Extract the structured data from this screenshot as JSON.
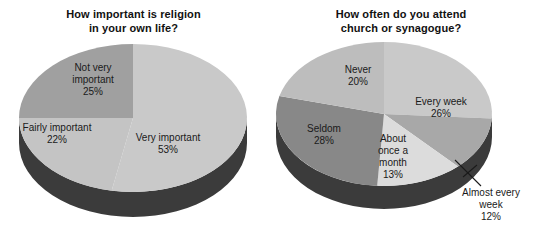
{
  "chart_data": [
    {
      "type": "pie",
      "id": "religion-importance",
      "title": "How important is religion\nin your own life?",
      "categories": [
        "Very important",
        "Not very important",
        "Fairly important"
      ],
      "values": [
        53,
        25,
        22
      ],
      "value_suffix": "%",
      "labels": [
        {
          "name": "Very important",
          "percent": "53%",
          "color": "#c9c9c9"
        },
        {
          "name": "Not very important",
          "percent": "25%",
          "color": "#a0a0a0"
        },
        {
          "name": "Fairly important",
          "percent": "22%",
          "color": "#c4c4c4"
        }
      ],
      "side_color": "#3b3b3b",
      "legend": "none",
      "grid": false
    },
    {
      "type": "pie",
      "id": "attendance-frequency",
      "title": "How often do you attend\nchurch or synagogue?",
      "categories": [
        "Every week",
        "Almost every week",
        "About once a month",
        "Seldom",
        "Never"
      ],
      "values": [
        26,
        12,
        13,
        28,
        20
      ],
      "value_suffix": "%",
      "labels": [
        {
          "name": "Every week",
          "percent": "26%",
          "color": "#c9c9c9"
        },
        {
          "name": "Almost every week",
          "percent": "12%",
          "color": "#a8a8a8"
        },
        {
          "name": "About once a month",
          "percent": "13%",
          "color": "#dcdcdc"
        },
        {
          "name": "Seldom",
          "percent": "28%",
          "color": "#888888"
        },
        {
          "name": "Never",
          "percent": "20%",
          "color": "#bdbdbd"
        }
      ],
      "side_color": "#3b3b3b",
      "legend": "none",
      "grid": false
    }
  ],
  "charts": {
    "religion": {
      "title": "How important is religion\nin your own life?",
      "slices": {
        "very": {
          "label": "Very important",
          "percent": "53%"
        },
        "notvery": {
          "label_line1": "Not very",
          "label_line2": "important",
          "percent": "25%"
        },
        "fairly": {
          "label": "Fairly important",
          "percent": "22%"
        }
      }
    },
    "attend": {
      "title": "How often do you attend\nchurch or synagogue?",
      "slices": {
        "everyweek": {
          "label": "Every week",
          "percent": "26%"
        },
        "almost": {
          "label_line1": "Almost every",
          "label_line2": "week",
          "percent": "12%"
        },
        "month": {
          "label_line1": "About",
          "label_line2": "once a",
          "label_line3": "month",
          "percent": "13%"
        },
        "seldom": {
          "label": "Seldom",
          "percent": "28%"
        },
        "never": {
          "label": "Never",
          "percent": "20%"
        }
      }
    }
  },
  "colors": {
    "background": "#ffffff",
    "text": "#1a1a1a",
    "title": "#111111",
    "pie_side": "#3b3b3b",
    "gray_light": "#dcdcdc",
    "gray_mid_light": "#c9c9c9",
    "gray_mid": "#a8a8a8",
    "gray_dark": "#888888"
  }
}
